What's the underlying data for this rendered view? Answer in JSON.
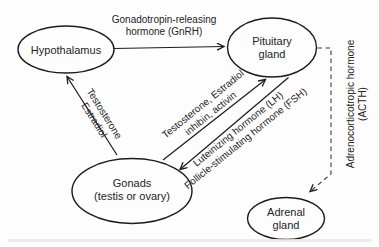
{
  "diagram": {
    "nodes": {
      "hypothalamus": {
        "label": "Hypothalamus"
      },
      "pituitary": {
        "line1": "Pituitary",
        "line2": "gland"
      },
      "gonads": {
        "line1": "Gonads",
        "line2": "(testis or ovary)"
      },
      "adrenal": {
        "line1": "Adrenal",
        "line2": "gland"
      }
    },
    "edges": {
      "gnrh": {
        "line1": "Gonadotropin-releasing",
        "line2": "hormone (GnRH)",
        "from": "Hypothalamus",
        "to": "Pituitary gland",
        "style": "solid-arrow"
      },
      "gonads_to_hypothalamus": {
        "line1": "Testosterone",
        "line2": "Estradiol",
        "from": "Gonads",
        "to": "Hypothalamus",
        "style": "solid-arrow"
      },
      "gonads_to_pituitary": {
        "line1": "Testosterone, Estradiol",
        "line2": "inhibin, activin",
        "from": "Gonads",
        "to": "Pituitary gland",
        "style": "solid-arrow"
      },
      "pituitary_to_gonads": {
        "line1": "Luteinizing hormone (LH)",
        "line2": "Follicle-stimulating hormone (FSH)",
        "from": "Pituitary gland",
        "to": "Gonads",
        "style": "solid-arrow"
      },
      "pituitary_to_adrenal": {
        "line1": "Adrenocorticotropic hormone",
        "line2": "(ACTH)",
        "from": "Pituitary gland",
        "to": "Adrenal gland",
        "style": "dashed-arrow"
      }
    },
    "colors": {
      "line": "#1c1c1c",
      "text": "#242424",
      "node_fill": "#fdfdfd",
      "background": "#fcfcfc"
    }
  }
}
